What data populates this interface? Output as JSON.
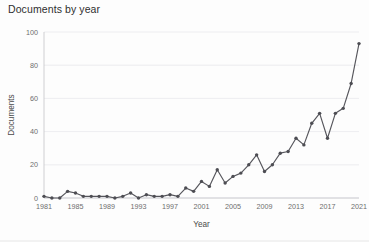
{
  "chart_data": {
    "type": "line",
    "title": "Documents by year",
    "xlabel": "Year",
    "ylabel": "Documents",
    "xlim": [
      1981,
      2021
    ],
    "ylim": [
      0,
      100
    ],
    "grid": true,
    "legend": false,
    "marker": "circle",
    "line_color": "#56565c",
    "marker_color": "#4d4d53",
    "y_ticks": [
      0,
      20,
      40,
      60,
      80,
      100
    ],
    "y_tick_labels": [
      "0",
      "20",
      "40",
      "60",
      "80",
      "100"
    ],
    "x_ticks": [
      1981,
      1985,
      1989,
      1993,
      1997,
      2001,
      2005,
      2009,
      2013,
      2017,
      2021
    ],
    "x_tick_labels": [
      "1981",
      "1985",
      "1989",
      "1993",
      "1997",
      "2001",
      "2005",
      "2009",
      "2013",
      "2017",
      "2021"
    ],
    "x": [
      1981,
      1982,
      1983,
      1984,
      1985,
      1986,
      1987,
      1988,
      1989,
      1990,
      1991,
      1992,
      1993,
      1994,
      1995,
      1996,
      1997,
      1998,
      1999,
      2000,
      2001,
      2002,
      2003,
      2004,
      2005,
      2006,
      2007,
      2008,
      2009,
      2010,
      2011,
      2012,
      2013,
      2014,
      2015,
      2016,
      2017,
      2018,
      2019,
      2020,
      2021
    ],
    "values": [
      1,
      0,
      0,
      4,
      3,
      1,
      1,
      1,
      1,
      0,
      1,
      3,
      0,
      2,
      1,
      1,
      2,
      1,
      6,
      4,
      10,
      7,
      17,
      9,
      13,
      15,
      20,
      26,
      16,
      20,
      27,
      28,
      36,
      32,
      45,
      51,
      36,
      51,
      54,
      69,
      93
    ],
    "categories": [
      "1981",
      "1982",
      "1983",
      "1984",
      "1985",
      "1986",
      "1987",
      "1988",
      "1989",
      "1990",
      "1991",
      "1992",
      "1993",
      "1994",
      "1995",
      "1996",
      "1997",
      "1998",
      "1999",
      "2000",
      "2001",
      "2002",
      "2003",
      "2004",
      "2005",
      "2006",
      "2007",
      "2008",
      "2009",
      "2010",
      "2011",
      "2012",
      "2013",
      "2014",
      "2015",
      "2016",
      "2017",
      "2018",
      "2019",
      "2020",
      "2021"
    ]
  }
}
